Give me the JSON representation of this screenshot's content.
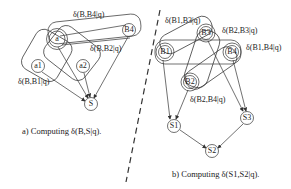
{
  "left_panel": {
    "caption": "a) Computing δ(B,S|q).",
    "nodes": {
      "a": "a",
      "a1": "a1",
      "a2": "a2",
      "b4": "B4",
      "s": "S"
    },
    "labels": {
      "top": "δ(B,B4|q)",
      "mid": "δ(B,B2|q)",
      "left": "δ(B,B1|q)"
    }
  },
  "right_panel": {
    "caption": "b) Computing δ(S1,S2|q).",
    "nodes": {
      "b1": "B1",
      "b2": "B2",
      "b3": "B3",
      "b4": "B4",
      "s1": "S1",
      "s2": "S2",
      "s3": "S3"
    },
    "labels": {
      "b1b3": "δ(B1,B3|q)",
      "b2b3": "δ(B2,B3|q)",
      "b1b4": "δ(B1,B4|q)",
      "b2b4": "δ(B2,B4|q)"
    }
  },
  "colors": {
    "stroke": "#333333",
    "text": "#222222",
    "background": "#ffffff"
  }
}
